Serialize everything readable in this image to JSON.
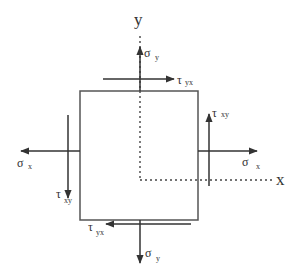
{
  "diagram": {
    "title": "",
    "type": "stress-element",
    "colors": {
      "line": "#444444",
      "background": "#ffffff"
    },
    "axes": {
      "x_label": "x",
      "y_label": "y"
    },
    "element": {
      "shape": "square"
    },
    "labels": {
      "sigma_y_top": {
        "symbol": "σ",
        "subscript": "y"
      },
      "tau_yx_top": {
        "symbol": "τ",
        "subscript": "yx"
      },
      "sigma_x_left": {
        "symbol": "σ",
        "subscript": "x"
      },
      "tau_xy_left": {
        "symbol": "τ",
        "subscript": "xy"
      },
      "tau_xy_right": {
        "symbol": "τ",
        "subscript": "xy"
      },
      "sigma_x_right": {
        "symbol": "σ",
        "subscript": "x"
      },
      "tau_yx_bottom": {
        "symbol": "τ",
        "subscript": "yx"
      },
      "sigma_y_bottom": {
        "symbol": "σ",
        "subscript": "y"
      }
    }
  }
}
